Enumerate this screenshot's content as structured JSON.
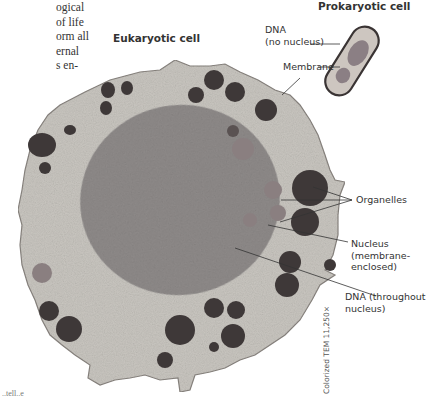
{
  "body_text_fragment": {
    "lines": [
      "ogical",
      "of life",
      "orm all",
      "ernal",
      "s en-"
    ]
  },
  "bottom_text_fragment": "..tell..e",
  "figure": {
    "eukaryotic_title": "Eukaryotic cell",
    "prokaryotic_title": "Prokaryotic cell",
    "labels": {
      "dna_prokaryote_line1": "DNA",
      "dna_prokaryote_line2": "(no nucleus)",
      "membrane": "Membrane",
      "organelles": "Organelles",
      "nucleus_line1": "Nucleus",
      "nucleus_line2": "(membrane-",
      "nucleus_line3": "enclosed)",
      "dna_eukaryote_line1": "DNA (throughout",
      "dna_eukaryote_line2": "nucleus)"
    },
    "credit": "Colorized TEM 11,250×",
    "colors": {
      "cytoplasm": "#c9c6c0",
      "nucleus": "#8f8b8a",
      "organelle_dark": "#3e3838",
      "organelle_medium": "#8a7f80",
      "membrane_outline": "#8a8580",
      "prokaryote_fill": "#cdc6c0",
      "prokaryote_dna": "#8b7f84",
      "prokaryote_edge": "#3a3434",
      "leader_line": "#333333"
    }
  }
}
